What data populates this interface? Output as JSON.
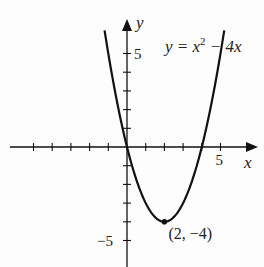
{
  "chart_data": {
    "type": "line",
    "title": "",
    "equation": "y = x² − 4x",
    "equation_parts": {
      "lhs": "y = x",
      "exp": "2",
      "rhs": " − 4x"
    },
    "xlabel": "x",
    "ylabel": "y",
    "xlim": [
      -6.2,
      6.8
    ],
    "ylim": [
      -6.3,
      6.8
    ],
    "x_tick_labels": [
      {
        "value": 5,
        "label": "5"
      }
    ],
    "y_tick_labels": [
      {
        "value": 5,
        "label": "5"
      },
      {
        "value": -5,
        "label": "−5"
      }
    ],
    "x_ticks": [
      -5,
      -4,
      -3,
      -2,
      -1,
      1,
      2,
      3,
      4,
      5
    ],
    "y_ticks": [
      -5,
      -4,
      -3,
      -2,
      -1,
      1,
      2,
      3,
      4,
      5
    ],
    "grid": false,
    "series": [
      {
        "name": "y = x^2 - 4x",
        "x_range": [
          -1.2,
          5.2
        ],
        "points": [
          [
            -1,
            5
          ],
          [
            0,
            0
          ],
          [
            1,
            -3
          ],
          [
            2,
            -4
          ],
          [
            3,
            -3
          ],
          [
            4,
            0
          ],
          [
            5,
            5
          ]
        ]
      }
    ],
    "annotations": [
      {
        "x": 2,
        "y": -4,
        "label": "(2, −4)",
        "marker": "dot"
      }
    ]
  }
}
